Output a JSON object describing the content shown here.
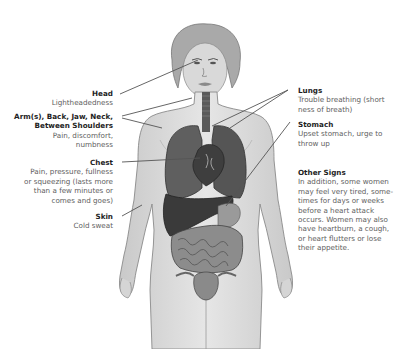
{
  "diagram": {
    "labels_left": [
      {
        "id": "head",
        "title": "Head",
        "desc": "Lightheadedness"
      },
      {
        "id": "arms",
        "title": "Arm(s), Back, Jaw, Neck, Between Shoulders",
        "title_line1": "Arm(s), Back, Jaw, Neck,",
        "title_line2": "Between Shoulders",
        "desc": "Pain, discomfort, numbness",
        "desc_line1": "Pain, discomfort,",
        "desc_line2": "numbness"
      },
      {
        "id": "chest",
        "title": "Chest",
        "desc": "Pain, pressure, fullness or squeezing (lasts more than a few minutes or comes and goes)",
        "desc_line1": "Pain, pressure, fullness",
        "desc_line2": "or squeezing (lasts more",
        "desc_line3": "than a few minutes or",
        "desc_line4": "comes and goes)"
      },
      {
        "id": "skin",
        "title": "Skin",
        "desc": "Cold sweat"
      }
    ],
    "labels_right": [
      {
        "id": "lungs",
        "title": "Lungs",
        "desc": "Trouble breathing (shortness of breath)",
        "desc_line1": "Trouble breathing (short",
        "desc_line2": "ness of breath)"
      },
      {
        "id": "stomach",
        "title": "Stomach",
        "desc": "Upset stomach, urge to throw up",
        "desc_line1": "Upset stomach, urge to",
        "desc_line2": "throw up"
      },
      {
        "id": "other",
        "title": "Other Signs",
        "desc": "In addition, some women may feel very tired, sometimes for days or weeks before a heart attack occurs. Women may also have heartburn, a cough, or heart flutters or lose their appetite.",
        "desc_lines": [
          "In addition, some women",
          "may feel very tired, some-",
          "times for days or weeks",
          "before a heart attack",
          "occurs. Women may also",
          "have heartburn, a cough,",
          "or heart flutters or lose",
          "their appetite."
        ]
      }
    ]
  }
}
